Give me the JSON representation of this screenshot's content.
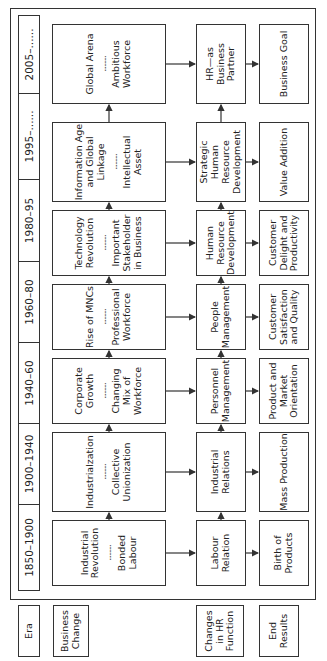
{
  "row_labels": {
    "era": "Era",
    "business_change": "Business Change",
    "hr_function": "Changes in HR Function",
    "end_results": "End Results"
  },
  "eras": [
    {
      "period": "1850–1900",
      "business_change_top": "Industrial Revolution",
      "business_change_bottom": "Bonded Labour",
      "hr_function": "Labour Relation",
      "end_result": "Birth of Products"
    },
    {
      "period": "1900–1940",
      "business_change_top": "Industrialzation",
      "business_change_bottom": "Collective Unionization",
      "hr_function": "Industrial Relations",
      "end_result": "Mass Production"
    },
    {
      "period": "1940–60",
      "business_change_top": "Corporate Growth",
      "business_change_bottom": "Changing Mix of Workforce",
      "hr_function": "Personnel Management",
      "end_result": "Product and Market Orientation"
    },
    {
      "period": "1960–80",
      "business_change_top": "Rise of MNCs",
      "business_change_bottom": "Professional Workforce",
      "hr_function": "People Management",
      "end_result": "Customer Satisfaction and Quality"
    },
    {
      "period": "1980–95",
      "business_change_top": "Technology Revolution",
      "business_change_bottom": "Important Stakeholder in Business",
      "hr_function": "Human Resource Development",
      "end_result": "Customer Delight and Productivity"
    },
    {
      "period": "1995–......",
      "business_change_top": "Information Age and Global Linkage",
      "business_change_bottom": "Intellectual Asset",
      "hr_function": "Strategic Human Resource Development",
      "end_result": "Value Addition"
    },
    {
      "period": "2005–......",
      "business_change_top": "Global Arena",
      "business_change_bottom": "Ambitious Workforce",
      "hr_function": "HR—as Business Partner",
      "end_result": "Business Goal"
    }
  ],
  "separator": "..........",
  "colors": {
    "line": "#333333",
    "text": "#222222",
    "background": "#ffffff"
  }
}
